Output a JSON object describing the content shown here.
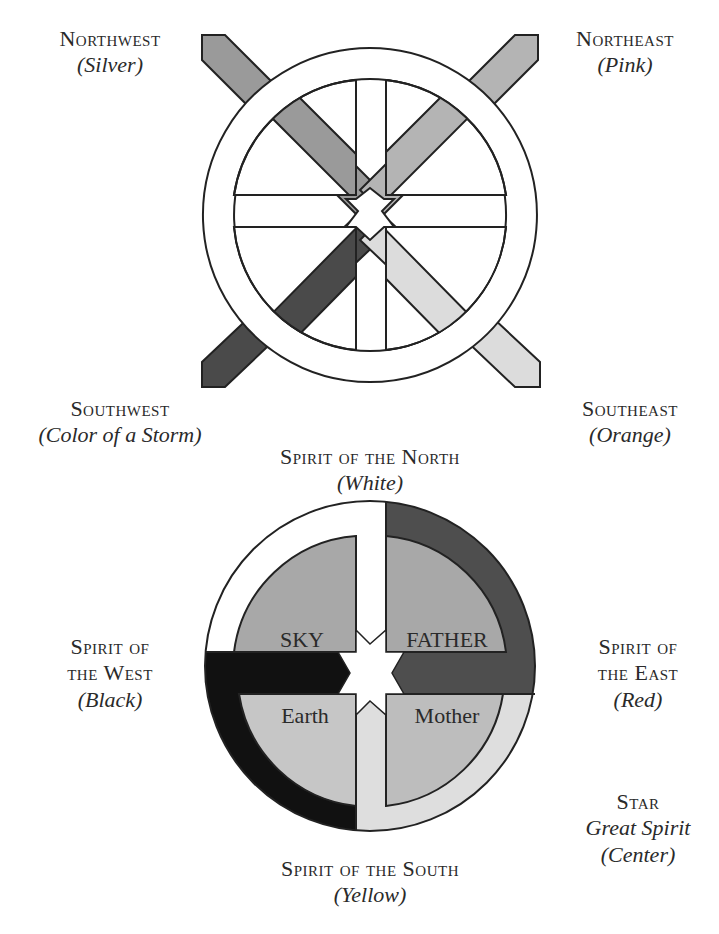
{
  "top_diagram": {
    "northwest": {
      "title": "Northwest",
      "color_name": "(Silver)",
      "fill": "#9a9a9a"
    },
    "northeast": {
      "title": "Northeast",
      "color_name": "(Pink)",
      "fill": "#b4b4b4"
    },
    "southwest": {
      "title": "Southwest",
      "color_name": "(Color of a Storm)",
      "fill": "#4a4a4a"
    },
    "southeast": {
      "title": "Southeast",
      "color_name": "(Orange)",
      "fill": "#dcdcdc"
    }
  },
  "bottom_diagram": {
    "north": {
      "title": "Spirit of the North",
      "color_name": "(White)",
      "fill": "#ffffff"
    },
    "west": {
      "title_line1": "Spirit of",
      "title_line2": "the West",
      "color_name": "(Black)",
      "fill": "#111111"
    },
    "east": {
      "title_line1": "Spirit of",
      "title_line2": "the East",
      "color_name": "(Red)",
      "fill": "#4e4e4e"
    },
    "south": {
      "title": "Spirit of the South",
      "color_name": "(Yellow)",
      "fill": "#dedede"
    },
    "center": {
      "title": "Star",
      "subtitle": "Great Spirit",
      "color_name": "(Center)"
    },
    "quadrants": {
      "top_left": {
        "text": "SKY",
        "fill": "#a8a8a8"
      },
      "top_right": {
        "text": "FATHER",
        "fill": "#a8a8a8"
      },
      "bottom_left": {
        "text": "Earth",
        "fill": "#c6c6c6"
      },
      "bottom_right": {
        "text": "Mother",
        "fill": "#bdbdbd"
      }
    }
  }
}
